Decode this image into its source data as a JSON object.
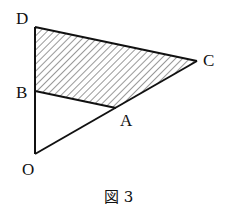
{
  "figure": {
    "caption": "図 3",
    "points": {
      "D": {
        "label": "D",
        "x": 35,
        "y": 27
      },
      "C": {
        "label": "C",
        "x": 197,
        "y": 61
      },
      "B": {
        "label": "B",
        "x": 35,
        "y": 91
      },
      "A": {
        "label": "A",
        "x": 116,
        "y": 108
      },
      "O": {
        "label": "O",
        "x": 35,
        "y": 154
      }
    },
    "shaded_region": [
      "D",
      "C",
      "A",
      "B"
    ],
    "segments": [
      [
        "O",
        "D"
      ],
      [
        "D",
        "C"
      ],
      [
        "O",
        "C"
      ],
      [
        "B",
        "A"
      ]
    ],
    "colors": {
      "line": "#111111",
      "hatch": "#333333",
      "background": "#ffffff"
    }
  }
}
